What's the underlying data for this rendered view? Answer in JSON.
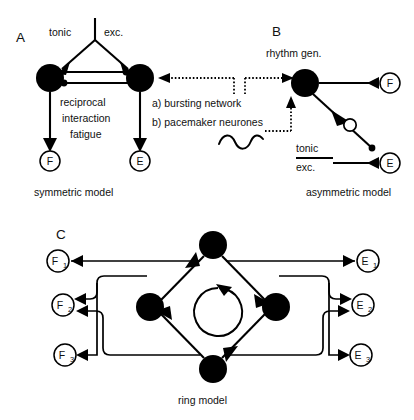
{
  "figure": {
    "background": "#ffffff",
    "ink": "#000000"
  },
  "panels": {
    "a": {
      "letter": "A",
      "caption": "symmetric model",
      "input_label_left": "tonic",
      "input_label_right": "exc.",
      "center_text_line1": "reciprocal",
      "center_text_line2": "interaction",
      "center_text_line3": "fatigue",
      "output_left": "F",
      "output_right": "E"
    },
    "b": {
      "letter": "B",
      "caption": "asymmetric model",
      "node_label": "rhythm gen.",
      "input_label_line1": "tonic",
      "input_label_line2": "exc.",
      "output_top": "F",
      "output_bottom": "E"
    },
    "c": {
      "letter": "C",
      "caption": "ring model",
      "flexor_labels": [
        "F",
        "F",
        "F"
      ],
      "flexor_subscripts": [
        "1",
        "2",
        "3"
      ],
      "extensor_labels": [
        "E",
        "E",
        "E"
      ],
      "extensor_subscripts": [
        "1",
        "2",
        "3"
      ]
    }
  },
  "middle_annotations": {
    "item_a": "a) bursting network",
    "item_b": "b) pacemaker neurones"
  }
}
